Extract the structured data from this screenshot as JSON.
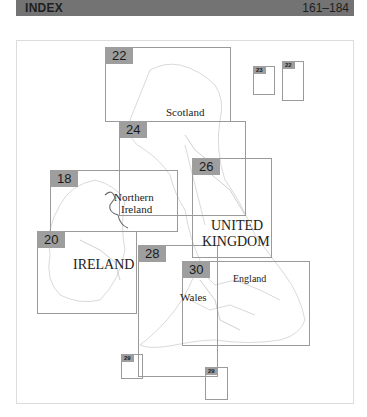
{
  "header": {
    "title": "INDEX",
    "pages": "161–184"
  },
  "sheets": [
    {
      "id": "22",
      "label": "22"
    },
    {
      "id": "23",
      "label": "23"
    },
    {
      "id": "22-inset",
      "label": "22"
    },
    {
      "id": "24",
      "label": "24"
    },
    {
      "id": "26",
      "label": "26"
    },
    {
      "id": "18",
      "label": "18"
    },
    {
      "id": "20",
      "label": "20"
    },
    {
      "id": "28",
      "label": "28"
    },
    {
      "id": "30",
      "label": "30"
    },
    {
      "id": "29a",
      "label": "29"
    },
    {
      "id": "29b",
      "label": "29"
    }
  ],
  "regions": {
    "scotland": "Scotland",
    "northern_ireland_1": "Northern",
    "northern_ireland_2": "Ireland",
    "uk_1": "UNITED",
    "uk_2": "KINGDOM",
    "ireland": "IRELAND",
    "england": "England",
    "wales": "Wales"
  },
  "colors": {
    "header_bg": "#737373",
    "sheet_tab": "#9e9e9e",
    "sheet_border": "#9a9a9a",
    "coastline": "#c8c8c8"
  }
}
